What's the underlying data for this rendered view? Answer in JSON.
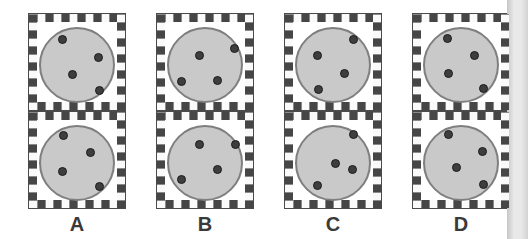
{
  "figure": {
    "options": [
      {
        "label": "A",
        "cells": [
          {
            "dots": [
              [
                33,
                25
              ],
              [
                69,
                43
              ],
              [
                43,
                60
              ],
              [
                70,
                76
              ]
            ]
          },
          {
            "dots": [
              [
                34,
                23
              ],
              [
                61,
                40
              ],
              [
                33,
                59
              ],
              [
                70,
                74
              ]
            ]
          }
        ]
      },
      {
        "label": "B",
        "cells": [
          {
            "dots": [
              [
                42,
                41
              ],
              [
                77,
                34
              ],
              [
                24,
                67
              ],
              [
                60,
                66
              ]
            ]
          },
          {
            "dots": [
              [
                42,
                32
              ],
              [
                78,
                32
              ],
              [
                60,
                57
              ],
              [
                24,
                67
              ]
            ]
          }
        ]
      },
      {
        "label": "C",
        "cells": [
          {
            "dots": [
              [
                68,
                25
              ],
              [
                32,
                41
              ],
              [
                59,
                59
              ],
              [
                33,
                75
              ]
            ]
          },
          {
            "dots": [
              [
                68,
                22
              ],
              [
                50,
                51
              ],
              [
                67,
                57
              ],
              [
                32,
                73
              ]
            ]
          }
        ]
      },
      {
        "label": "D",
        "cells": [
          {
            "dots": [
              [
                34,
                24
              ],
              [
                61,
                41
              ],
              [
                35,
                59
              ],
              [
                70,
                74
              ]
            ]
          },
          {
            "dots": [
              [
                35,
                22
              ],
              [
                69,
                39
              ],
              [
                43,
                55
              ],
              [
                70,
                72
              ]
            ]
          }
        ]
      }
    ],
    "style": {
      "checker_dark": "#464646",
      "checker_light": "#fafafa",
      "checker_grid_line": "#8a8a8a",
      "cell_outline": "#4a4a4a",
      "circle_fill": "#c9c9c9",
      "circle_stroke": "#7f7f7f",
      "dot_fill": "#3e3e3e",
      "dot_stroke": "#1c1c1c",
      "label_color": "#3a3a3a",
      "background": "#ffffff",
      "page_edge_from": "#c6c6c6",
      "page_edge_mid": "#e9e9e9",
      "page_edge_to": "#d2d2d2"
    }
  }
}
